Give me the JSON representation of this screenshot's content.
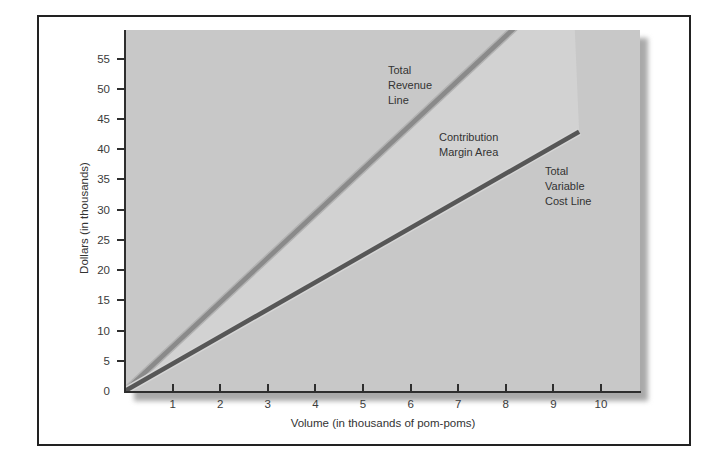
{
  "figure": {
    "background": "#ffffff",
    "border_color": "#222222",
    "shadow_color": "#a9a9a9"
  },
  "chart_data": {
    "type": "line",
    "title": "",
    "xlabel": "Volume (in thousands of pom-poms)",
    "ylabel": "Dollars (in thousands)",
    "xlim": [
      0,
      10.8
    ],
    "ylim": [
      0,
      60
    ],
    "grid": false,
    "legend": "inline-annotations",
    "plot_background": "#c8c8c8",
    "axis_color": "#2e2e2e",
    "x_ticks": [
      1,
      2,
      3,
      4,
      5,
      6,
      7,
      8,
      9,
      10
    ],
    "y_ticks": [
      0,
      5,
      10,
      15,
      20,
      25,
      30,
      35,
      40,
      45,
      50,
      55
    ],
    "series": [
      {
        "name": "Total Revenue Line",
        "slope_dollars_per_thousand_units": 7.3,
        "points": [
          [
            0,
            0
          ],
          [
            8.35,
            61.3
          ]
        ],
        "clipped_at_top": true,
        "color": "#8a8a8a",
        "edge_color": "#b2b2b2"
      },
      {
        "name": "Total Variable Cost Line",
        "slope_dollars_per_thousand_units": 4.5,
        "points": [
          [
            0,
            0
          ],
          [
            9.54,
            42.9
          ]
        ],
        "clipped_at_top": false,
        "color": "#575757",
        "edge_color": "#d6d6d6"
      }
    ],
    "area": {
      "name": "Contribution Margin Area",
      "between": [
        "Total Revenue Line",
        "Total Variable Cost Line"
      ],
      "polygon": [
        [
          0,
          0
        ],
        [
          8.2,
          59.7
        ],
        [
          9.45,
          59.7
        ],
        [
          9.54,
          42.9
        ]
      ],
      "color": "#d2d2d2"
    },
    "annotations": [
      {
        "id": "revenue",
        "text": "Total\nRevenue\nLine"
      },
      {
        "id": "contribution",
        "text": "Contribution\nMargin Area"
      },
      {
        "id": "variable",
        "text": "Total\nVariable\nCost Line"
      }
    ]
  }
}
